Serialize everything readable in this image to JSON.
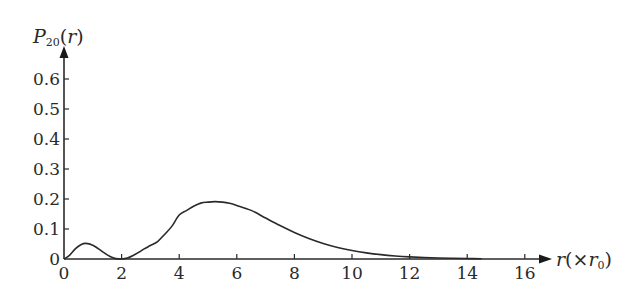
{
  "chart_data": {
    "type": "line",
    "title": "",
    "xlabel": "r(×r₀)",
    "ylabel": "P₂₀(r)",
    "ylabel_parts": {
      "main": "P",
      "sub": "20",
      "arg": "(r)"
    },
    "xlabel_parts": {
      "var": "r",
      "open": "(×",
      "unit": "r",
      "sub": "0",
      "close": ")"
    },
    "xlim": [
      0,
      16.8
    ],
    "ylim": [
      0,
      0.7
    ],
    "xticks": [
      0,
      2,
      4,
      6,
      8,
      10,
      12,
      14,
      16
    ],
    "xtick_labels": [
      "0",
      "2",
      "4",
      "6",
      "8",
      "10",
      "12",
      "14",
      "16"
    ],
    "yticks": [
      0,
      0.1,
      0.2,
      0.3,
      0.4,
      0.5,
      0.6
    ],
    "ytick_labels": [
      "0",
      "0.1",
      "0.2",
      "0.3",
      "0.4",
      "0.5",
      "0.6"
    ],
    "grid": false,
    "legend": null,
    "annotations": [],
    "series": [
      {
        "name": "P20(r)",
        "color": "#2a2a2a",
        "x": [
          0,
          0.2,
          0.4,
          0.6,
          0.76,
          1.0,
          1.2,
          1.4,
          1.6,
          1.8,
          2.0,
          2.2,
          2.4,
          2.6,
          2.8,
          3.0,
          3.25,
          3.5,
          3.75,
          4.0,
          4.25,
          4.5,
          4.75,
          5.0,
          5.24,
          5.5,
          5.75,
          6.0,
          6.5,
          7.0,
          7.5,
          8.0,
          8.5,
          9.0,
          9.5,
          10.0,
          10.5,
          11.0,
          11.5,
          12.0,
          12.5,
          13.0,
          13.5,
          14.0,
          14.5
        ],
        "values": [
          0,
          0.0131,
          0.0345,
          0.0483,
          0.052,
          0.046,
          0.0338,
          0.0203,
          0.0083,
          0.0013,
          0.0,
          0.0032,
          0.0116,
          0.0226,
          0.0347,
          0.0448,
          0.0582,
          0.0827,
          0.1096,
          0.1465,
          0.1614,
          0.1757,
          0.1862,
          0.1895,
          0.1912,
          0.1897,
          0.1856,
          0.1785,
          0.1621,
          0.1366,
          0.1116,
          0.0886,
          0.0685,
          0.0519,
          0.0385,
          0.0282,
          0.0203,
          0.0145,
          0.0102,
          0.0071,
          0.0049,
          0.0033,
          0.0023,
          0.0015,
          0.001
        ]
      }
    ]
  }
}
